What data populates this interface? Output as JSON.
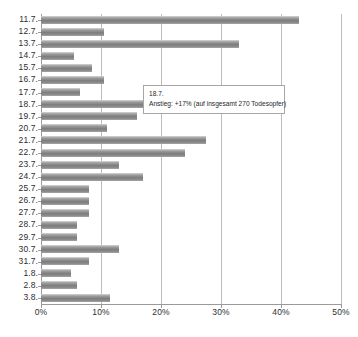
{
  "chart_data": {
    "type": "bar",
    "orientation": "horizontal",
    "title": "",
    "xlabel": "",
    "ylabel": "",
    "xlim": [
      0,
      50
    ],
    "ylim": null,
    "grid": true,
    "legend": null,
    "xticks": [
      "0%",
      "10%",
      "20%",
      "30%",
      "40%",
      "50%"
    ],
    "xtick_values": [
      0,
      10,
      20,
      30,
      40,
      50
    ],
    "categories": [
      "11.7.",
      "12.7.",
      "13.7.",
      "14.7.",
      "15.7.",
      "16.7.",
      "17.7.",
      "18.7.",
      "19.7.",
      "20.7.",
      "21.7.",
      "22.7.",
      "23.7.",
      "24.7.",
      "25.7.",
      "26.7.",
      "27.7.",
      "28.7.",
      "29.7.",
      "30.7.",
      "31.7.",
      "1.8.",
      "2.8.",
      "3.8."
    ],
    "values": [
      43,
      10.5,
      33,
      5.5,
      8.5,
      10.5,
      6.5,
      17,
      16,
      11,
      27.5,
      24,
      13,
      17,
      8,
      8,
      8,
      6,
      6,
      13,
      8,
      5,
      6,
      11.5
    ],
    "value_unit": "%",
    "bar_color": "#858585",
    "gridline_color": "#bdbdbd",
    "axis_color": "#9a9a9a",
    "annotations": [
      {
        "attached_to": "18.7.",
        "title": "18.7.",
        "body": "Anstieg: +17% (auf insgesamt 270 Todesopfer)"
      }
    ]
  }
}
